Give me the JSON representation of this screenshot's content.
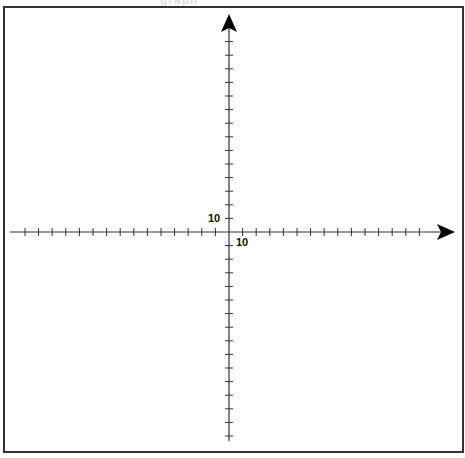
{
  "header": {
    "cropped_title_fragment": "graph"
  },
  "coordinate_plane": {
    "origin": {
      "x": 229,
      "y": 232
    },
    "tick_spacing_px": 13.6,
    "x_axis": {
      "label": "10",
      "label_meaning": "scale marker at first tick right of origin",
      "left_end": 10,
      "right_arrow_tip": 455,
      "direction": "right arrow"
    },
    "y_axis": {
      "label": "10",
      "label_meaning": "scale marker at first tick above origin",
      "top_arrow_tip": 14,
      "bottom_end": 441,
      "direction": "up arrow"
    },
    "colors": {
      "axis": "#333333",
      "arrow": "#000000",
      "frame": "#333333",
      "background": "#ffffff"
    }
  },
  "chart_data": {
    "type": "scatter",
    "title": "",
    "xlabel": "",
    "ylabel": "",
    "x_tick_labels": [
      "10"
    ],
    "y_tick_labels": [
      "10"
    ],
    "x_scale_per_tick": 10,
    "y_scale_per_tick": 10,
    "xlim": [
      -160,
      160
    ],
    "ylim": [
      -150,
      160
    ],
    "grid": false,
    "points": []
  }
}
